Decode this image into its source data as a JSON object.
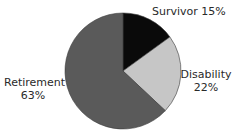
{
  "chart_data": {
    "type": "pie",
    "title": "",
    "categories": [
      "Survivor",
      "Disability",
      "Retirement"
    ],
    "values": [
      15,
      22,
      63
    ],
    "unit": "%",
    "colors": [
      "#0a0a0a",
      "#c6c6c6",
      "#5a5a5a"
    ],
    "start_angle": "12 o'clock",
    "direction": "clockwise",
    "legend": "none (direct slice labels)"
  },
  "labels": {
    "survivor": {
      "name": "Survivor",
      "value": "15%"
    },
    "disability": {
      "name": "Disability",
      "value": "22%"
    },
    "retirement": {
      "name": "Retirement",
      "value": "63%"
    }
  }
}
